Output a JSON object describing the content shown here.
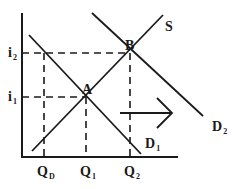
{
  "diagram": {
    "axes": {
      "y_labels": [
        {
          "id": "i2",
          "base": "i",
          "sub": "2"
        },
        {
          "id": "i1",
          "base": "i",
          "sub": "1"
        }
      ],
      "x_labels": [
        {
          "id": "QD",
          "base": "Q",
          "sub": "D"
        },
        {
          "id": "Q1",
          "base": "Q",
          "sub": "1"
        },
        {
          "id": "Q2",
          "base": "Q",
          "sub": "2"
        }
      ]
    },
    "curves": {
      "supply": {
        "label": "S"
      },
      "demand1": {
        "base": "D",
        "sub": "1"
      },
      "demand2": {
        "base": "D",
        "sub": "2"
      }
    },
    "points": {
      "A": "A",
      "B": "B"
    },
    "shift_arrow": "right-arrow",
    "colors": {
      "line": "#1a1a1a",
      "background": "#ffffff"
    }
  }
}
